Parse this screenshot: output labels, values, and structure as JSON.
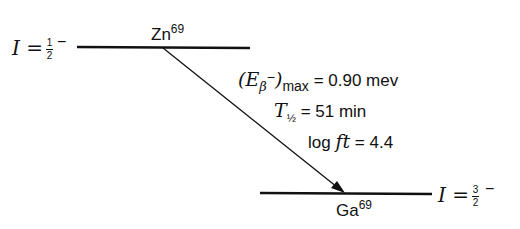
{
  "diagram": {
    "parent": {
      "element": "Zn",
      "mass": "69",
      "spin_label": "I =",
      "spin_num": "1",
      "spin_den": "2",
      "parity": "−"
    },
    "daughter": {
      "element": "Ga",
      "mass": "69",
      "spin_label": "I =",
      "spin_num": "3",
      "spin_den": "2",
      "parity": "−"
    },
    "annotations": {
      "energy_lhs": "(E",
      "energy_sub": "β",
      "energy_sup": "−",
      "energy_close": ")",
      "energy_max": "max",
      "energy_value": "= 0.90 mev",
      "halflife_T": "T",
      "halflife_sub": "½",
      "halflife_value": "= 51 min",
      "logft_label": "log ",
      "logft_ft": "ft",
      "logft_value": " = 4.4"
    }
  }
}
